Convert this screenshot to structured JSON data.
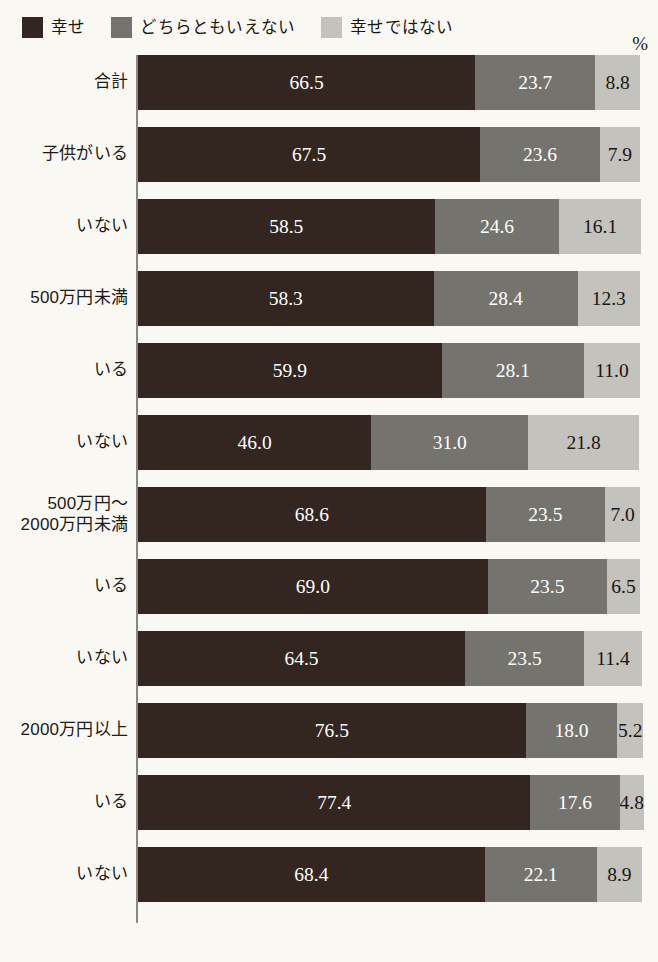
{
  "legend": {
    "items": [
      {
        "label": "幸せ",
        "color": "#332620",
        "swatch_name": "legend-swatch-happy"
      },
      {
        "label": "どちらともいえない",
        "color": "#75736e",
        "swatch_name": "legend-swatch-neutral"
      },
      {
        "label": "幸せではない",
        "color": "#c3c2bd",
        "swatch_name": "legend-swatch-unhappy"
      }
    ]
  },
  "axis": {
    "unit_label": "%"
  },
  "chart_data": {
    "type": "bar",
    "orientation": "horizontal",
    "stacked": true,
    "normalized_percent": true,
    "title": "",
    "xlabel": "%",
    "ylabel": "",
    "xlim": [
      0,
      100
    ],
    "grid": false,
    "legend_position": "top-left",
    "categories": [
      "合計",
      "子供がいる",
      "いない",
      "500万円未満",
      "いる",
      "いない",
      "500万円〜\n2000万円未満",
      "いる",
      "いない",
      "2000万円以上",
      "いる",
      "いない"
    ],
    "series": [
      {
        "name": "幸せ",
        "color": "#332620",
        "values": [
          66.5,
          67.5,
          58.5,
          58.3,
          59.9,
          46.0,
          68.6,
          69.0,
          64.5,
          76.5,
          77.4,
          68.4
        ]
      },
      {
        "name": "どちらともいえない",
        "color": "#75736e",
        "values": [
          23.7,
          23.6,
          24.6,
          28.4,
          28.1,
          31.0,
          23.5,
          23.5,
          23.5,
          18.0,
          17.6,
          22.1
        ]
      },
      {
        "name": "幸せではない",
        "color": "#c3c2bd",
        "values": [
          8.8,
          7.9,
          16.1,
          12.3,
          11.0,
          21.8,
          7.0,
          6.5,
          11.4,
          5.2,
          4.8,
          8.9
        ]
      }
    ],
    "rows": [
      {
        "label": "合計",
        "values": [
          "66.5",
          "23.7",
          "8.8"
        ]
      },
      {
        "label": "子供がいる",
        "values": [
          "67.5",
          "23.6",
          "7.9"
        ]
      },
      {
        "label": "いない",
        "values": [
          "58.5",
          "24.6",
          "16.1"
        ]
      },
      {
        "label": "500万円未満",
        "values": [
          "58.3",
          "28.4",
          "12.3"
        ]
      },
      {
        "label": "いる",
        "values": [
          "59.9",
          "28.1",
          "11.0"
        ]
      },
      {
        "label": "いない",
        "values": [
          "46.0",
          "31.0",
          "21.8"
        ]
      },
      {
        "label": "500万円〜\n2000万円未満",
        "values": [
          "68.6",
          "23.5",
          "7.0"
        ]
      },
      {
        "label": "いる",
        "values": [
          "69.0",
          "23.5",
          "6.5"
        ]
      },
      {
        "label": "いない",
        "values": [
          "64.5",
          "23.5",
          "11.4"
        ]
      },
      {
        "label": "2000万円以上",
        "values": [
          "76.5",
          "18.0",
          "5.2"
        ]
      },
      {
        "label": "いる",
        "values": [
          "77.4",
          "17.6",
          "4.8"
        ]
      },
      {
        "label": "いない",
        "values": [
          "68.4",
          "22.1",
          "8.9"
        ]
      }
    ]
  }
}
